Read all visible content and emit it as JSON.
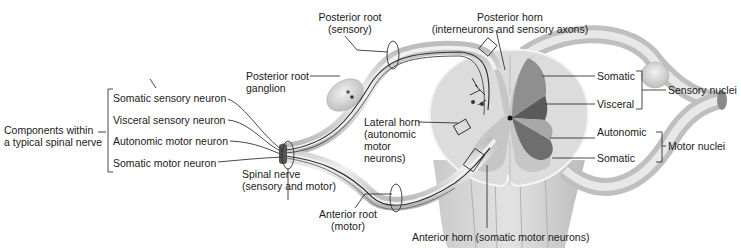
{
  "diagram": {
    "colors": {
      "background": "#ffffff",
      "nerve_fill": "#d4d4d4",
      "nerve_highlight": "#eeeeee",
      "cord_white_matter": "#d9d9d9",
      "cord_gray_matter": "#c2c2c2",
      "somatic_sensory_region": "#8f8f8f",
      "visceral_sensory_region": "#5a5a5a",
      "autonomic_motor_region": "#a8a8a8",
      "somatic_motor_region": "#6e6e6e",
      "text": "#1a1a1a",
      "leader_lines": "#333333"
    },
    "components_group": {
      "label": "Components within\na typical spinal nerve",
      "items": [
        {
          "label": "Somatic sensory neuron"
        },
        {
          "label": "Visceral sensory neuron"
        },
        {
          "label": "Autonomic motor neuron"
        },
        {
          "label": "Somatic motor neuron"
        }
      ]
    },
    "labels": {
      "posterior_root": "Posterior root\n(sensory)",
      "posterior_root_ganglion": "Posterior root\nganglion",
      "spinal_nerve": "Spinal nerve\n(sensory and motor)",
      "anterior_root": "Anterior root\n(motor)",
      "lateral_horn": "Lateral horn\n(autonomic\nmotor\nneurons)",
      "posterior_horn": "Posterior horn\n(interneurons and sensory axons)",
      "anterior_horn": "Anterior horn (somatic motor neurons)"
    },
    "nuclei": {
      "sensory": {
        "label": "Sensory nuclei",
        "items": [
          {
            "label": "Somatic"
          },
          {
            "label": "Visceral"
          }
        ]
      },
      "motor": {
        "label": "Motor nuclei",
        "items": [
          {
            "label": "Autonomic"
          },
          {
            "label": "Somatic"
          }
        ]
      }
    }
  }
}
